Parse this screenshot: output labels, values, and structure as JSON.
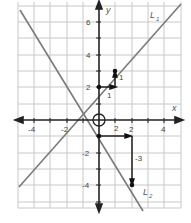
{
  "graph": {
    "x_axis_label": "x",
    "y_axis_label": "y",
    "x_ticks": [
      {
        "value": -4,
        "label": "-4"
      },
      {
        "value": -2,
        "label": "-2"
      },
      {
        "value": 2,
        "label": "2"
      },
      {
        "value": 4,
        "label": "4"
      }
    ],
    "y_ticks": [
      {
        "value": 6,
        "label": "6"
      },
      {
        "value": 4,
        "label": "4"
      },
      {
        "value": 2,
        "label": "2"
      },
      {
        "value": -2,
        "label": "-2"
      },
      {
        "value": -4,
        "label": "-4"
      }
    ],
    "lines": [
      {
        "name": "L",
        "subscript": "1",
        "equation": "y = x + 2",
        "slope": 1,
        "intercept": 2
      },
      {
        "name": "L",
        "subscript": "2",
        "equation": "y = -1.5x - 1",
        "slope": -1.5,
        "intercept": -1
      }
    ],
    "slope_triangle_1": {
      "run_label": "1",
      "rise_label": "1",
      "from": [
        0,
        2
      ],
      "to": [
        1,
        3
      ]
    },
    "slope_triangle_2": {
      "run_label": "2",
      "rise_label": "-3",
      "from": [
        0,
        -1
      ],
      "to": [
        2,
        -4
      ]
    },
    "origin_marker": "circle",
    "colors": {
      "grid": "#c8c8c8",
      "axis": "#222222",
      "line": "#777777",
      "arrow": "#111111"
    }
  }
}
